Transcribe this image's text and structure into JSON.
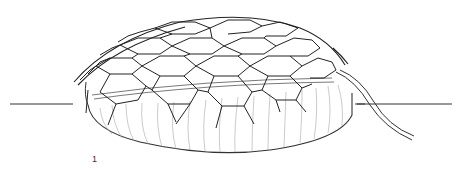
{
  "figure": {
    "number_label": "1",
    "colors": {
      "background": "#ffffff",
      "ink": "#222222",
      "light_ink": "#9a9a9a"
    }
  }
}
